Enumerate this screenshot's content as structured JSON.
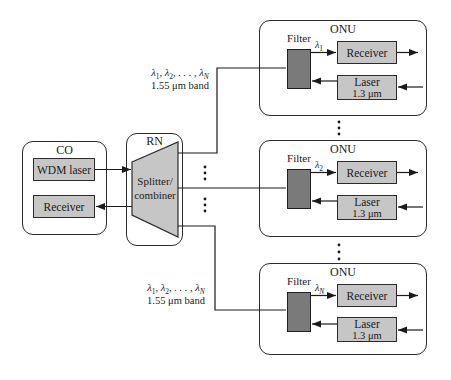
{
  "co": {
    "title": "CO",
    "wdm_laser_label": "WDM laser",
    "receiver_label": "Receiver"
  },
  "rn": {
    "title": "RN",
    "splitter_line1": "Splitter/",
    "splitter_line2": "combiner"
  },
  "top_band": {
    "seq": [
      {
        "t": "λ",
        "sub": "1"
      },
      {
        "t": ", λ",
        "sub": "2"
      },
      {
        "t": ", . . . , λ",
        "sub": "N"
      }
    ],
    "line2": "1.55 μm band"
  },
  "bottom_band": {
    "seq": [
      {
        "t": "λ",
        "sub": "1"
      },
      {
        "t": ", λ",
        "sub": "2"
      },
      {
        "t": ", . . . , λ",
        "sub": "N"
      }
    ],
    "line2": "1.55 μm band"
  },
  "onus": [
    {
      "title": "ONU",
      "filter_label": "Filter",
      "lambda": "λ",
      "lambda_sub": "1",
      "receiver_label": "Receiver",
      "laser_line1": "Laser",
      "laser_line2": "1.3 μm"
    },
    {
      "title": "ONU",
      "filter_label": "Filter",
      "lambda": "λ",
      "lambda_sub": "2",
      "receiver_label": "Receiver",
      "laser_line1": "Laser",
      "laser_line2": "1.3 μm"
    },
    {
      "title": "ONU",
      "filter_label": "Filter",
      "lambda": "λ",
      "lambda_sub": "N",
      "receiver_label": "Receiver",
      "laser_line1": "Laser",
      "laser_line2": "1.3 μm"
    }
  ],
  "colors": {
    "background": "#ffffff",
    "box_fill": "#c6c6c6",
    "filter_fill": "#7a7a7a",
    "border": "#2b2b2b",
    "wire": "#1a1a1a"
  }
}
